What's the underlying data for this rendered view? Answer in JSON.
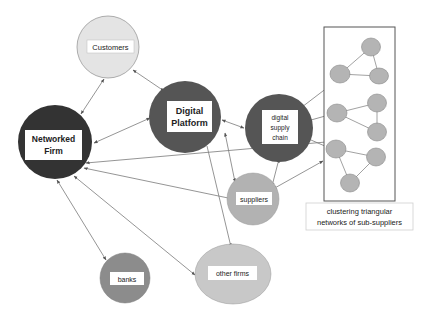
{
  "diagram": {
    "nodes": {
      "customers": {
        "label": "Customers",
        "fill": "#e4e4e4"
      },
      "digital_platform": {
        "line1": "Digital",
        "line2": "Platform",
        "fill": "#555555"
      },
      "networked_firm": {
        "line1": "Networked",
        "line2": "Firm",
        "fill": "#333333"
      },
      "digital_supply_chain": {
        "line1": "digital",
        "line2": "supply",
        "line3": "chain",
        "fill": "#555555"
      },
      "suppliers": {
        "label": "suppliers",
        "fill": "#b2b2b2"
      },
      "banks": {
        "label": "banks",
        "fill": "#8c8c8c"
      },
      "other_firms": {
        "label": "other firms",
        "fill": "#c8c8c8"
      }
    },
    "cluster": {
      "caption_line1": "clustering triangular",
      "caption_line2": "networks of sub-suppliers",
      "node_fill": "#b4b4b4"
    },
    "edges": [
      {
        "from": "Networked Firm",
        "to": "Customers",
        "type": "bidirectional"
      },
      {
        "from": "Customers",
        "to": "Digital Platform",
        "type": "bidirectional"
      },
      {
        "from": "Networked Firm",
        "to": "Digital Platform",
        "type": "bidirectional"
      },
      {
        "from": "Digital Platform",
        "to": "digital supply chain",
        "type": "bidirectional"
      },
      {
        "from": "Digital Platform",
        "to": "suppliers",
        "type": "bidirectional"
      },
      {
        "from": "digital supply chain",
        "to": "suppliers",
        "type": "bidirectional"
      },
      {
        "from": "suppliers",
        "to": "sub-supplier cluster",
        "type": "bidirectional"
      },
      {
        "from": "Networked Firm",
        "to": "suppliers",
        "type": "bidirectional"
      },
      {
        "from": "Networked Firm",
        "to": "sub-supplier cluster",
        "type": "directed"
      },
      {
        "from": "Networked Firm",
        "to": "banks",
        "type": "bidirectional"
      },
      {
        "from": "Networked Firm",
        "to": "other firms",
        "type": "bidirectional"
      },
      {
        "from": "Digital Platform",
        "to": "other firms",
        "type": "directed"
      }
    ]
  }
}
